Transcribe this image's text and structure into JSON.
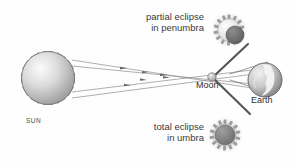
{
  "figure": {
    "background_color": "#fefefe",
    "width": 295,
    "height": 163
  },
  "labels": {
    "partial_eclipse": {
      "line1": "partial eclipse",
      "line2": "in penumbra"
    },
    "total_eclipse": {
      "line1": "total eclipse",
      "line2": "in umbra"
    },
    "sun": "SUN",
    "moon": "Moon",
    "earth": "Earth"
  },
  "bodies": {
    "sun": {
      "name": "sun",
      "center_x": 48,
      "center_y": 78,
      "radius": 27,
      "ray_count": 12,
      "ray_length": 17,
      "fill_light": "#f2f2f2",
      "fill_dark": "#9a9a9a",
      "stroke": "#6f6f6f"
    },
    "moon": {
      "name": "moon",
      "center_x": 212,
      "center_y": 77,
      "radius": 4,
      "fill_light": "#e8e8e8",
      "fill_dark": "#a8a8a8",
      "stroke": "#666666"
    },
    "earth": {
      "name": "earth",
      "center_x": 265,
      "center_y": 80,
      "radius": 17,
      "fill_light": "#e6e6e6",
      "fill_dark": "#8d8d8d",
      "stroke": "#5f5f5f",
      "continent_fill": "#f4f4f4"
    }
  },
  "icons": {
    "partial_eclipse_icon": {
      "name": "partial-eclipse-icon",
      "center_x": 229,
      "center_y": 30,
      "sun_radius": 11,
      "ray_count": 14,
      "disc_offset_x": 6,
      "disc_offset_y": 5,
      "disc_radius": 9,
      "sun_fill": "#f5f5f5",
      "disc_fill": "#787878",
      "ray_fill": "#9c9c9c",
      "glow": "#dcdcdc"
    },
    "total_eclipse_icon": {
      "name": "total-eclipse-icon",
      "center_x": 225,
      "center_y": 135,
      "sun_radius": 11,
      "ray_count": 14,
      "disc_radius": 10,
      "sun_fill": "#f5f5f5",
      "disc_fill": "#8a8a8a",
      "ray_fill": "#9c9c9c",
      "glow": "#dcdcdc"
    }
  },
  "light_rays": {
    "name": "light-rays",
    "color": "#8d8d8d",
    "arrow_color": "#6a6a6a",
    "count": 4,
    "description": "Rays of sunlight travelling from the Sun past the Moon toward the Earth, crossing near the Moon."
  },
  "shadow_lines": {
    "name": "shadow-cone-lines",
    "color": "#555555",
    "description": "Dark penumbra boundary lines diverging from the Moon past the Earth."
  },
  "colors": {
    "text": "#3a3a3a",
    "outline": "#6f6f6f",
    "background": "#fefefe"
  }
}
